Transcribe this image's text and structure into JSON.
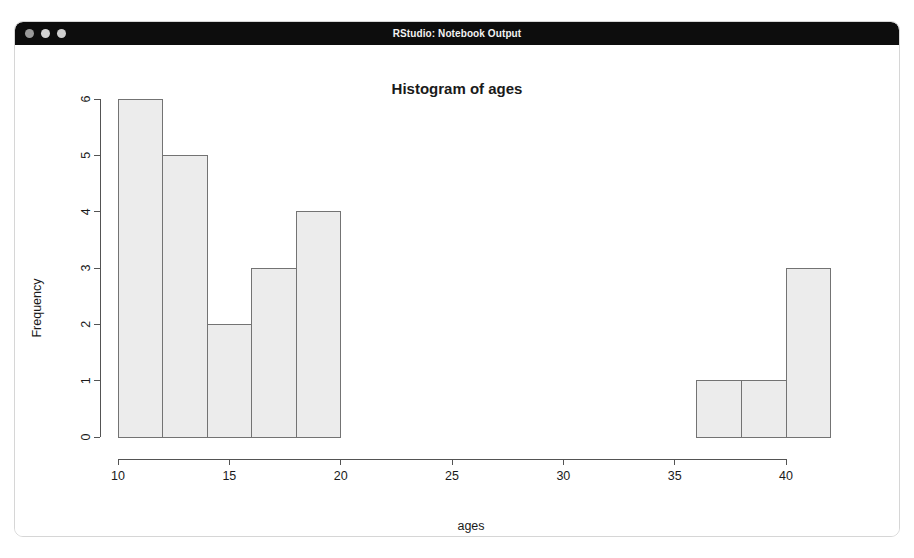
{
  "window": {
    "title": "RStudio: Notebook Output",
    "traffic_lights": [
      "close-dot",
      "minimize-dot",
      "zoom-dot"
    ],
    "titlebar_color": "#0d0d0d",
    "frame_color": "#d6d6d6"
  },
  "chart_data": {
    "type": "bar",
    "title": "Histogram of ages",
    "xlabel": "ages",
    "ylabel": "Frequency",
    "xlim": [
      10,
      42
    ],
    "ylim": [
      0,
      6
    ],
    "xticks": [
      10,
      15,
      20,
      25,
      30,
      35,
      40
    ],
    "xtick_labels": [
      "10",
      "15",
      "20",
      "25",
      "30",
      "35",
      "40"
    ],
    "yticks": [
      0,
      1,
      2,
      3,
      4,
      5,
      6
    ],
    "ytick_labels": [
      "0",
      "1",
      "2",
      "3",
      "4",
      "5",
      "6"
    ],
    "grid": false,
    "legend": null,
    "bin_width": 2,
    "bins": [
      {
        "x0": 10,
        "x1": 12,
        "value": 6
      },
      {
        "x0": 12,
        "x1": 14,
        "value": 5
      },
      {
        "x0": 14,
        "x1": 16,
        "value": 2
      },
      {
        "x0": 16,
        "x1": 18,
        "value": 3
      },
      {
        "x0": 18,
        "x1": 20,
        "value": 4
      },
      {
        "x0": 20,
        "x1": 22,
        "value": 0
      },
      {
        "x0": 22,
        "x1": 24,
        "value": 0
      },
      {
        "x0": 24,
        "x1": 26,
        "value": 0
      },
      {
        "x0": 26,
        "x1": 28,
        "value": 0
      },
      {
        "x0": 28,
        "x1": 30,
        "value": 0
      },
      {
        "x0": 30,
        "x1": 32,
        "value": 0
      },
      {
        "x0": 32,
        "x1": 34,
        "value": 0
      },
      {
        "x0": 34,
        "x1": 36,
        "value": 0
      },
      {
        "x0": 36,
        "x1": 38,
        "value": 1
      },
      {
        "x0": 38,
        "x1": 40,
        "value": 1
      },
      {
        "x0": 40,
        "x1": 42,
        "value": 3
      }
    ],
    "categories": [
      "10-12",
      "12-14",
      "14-16",
      "16-18",
      "18-20",
      "20-22",
      "22-24",
      "24-26",
      "26-28",
      "28-30",
      "30-32",
      "32-34",
      "34-36",
      "36-38",
      "38-40",
      "40-42"
    ],
    "values": [
      6,
      5,
      2,
      3,
      4,
      0,
      0,
      0,
      0,
      0,
      0,
      0,
      0,
      1,
      1,
      3
    ],
    "bar_fill": "#ececec",
    "bar_stroke": "#737373",
    "axis_color": "#545454"
  }
}
